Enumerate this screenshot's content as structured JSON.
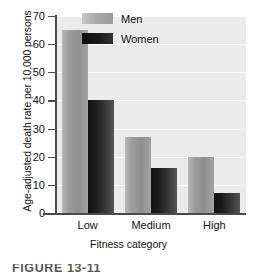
{
  "chart_data": {
    "type": "bar",
    "title": "",
    "subtitle": "",
    "xlabel": "Fitness category",
    "ylabel": "Age-adjusted death rate per 10,000 persons",
    "categories": [
      "Low",
      "Medium",
      "High"
    ],
    "series": [
      {
        "name": "Men",
        "values": [
          65,
          27,
          20
        ]
      },
      {
        "name": "Women",
        "values": [
          40,
          16,
          7
        ]
      }
    ],
    "yticks": [
      0,
      10,
      20,
      30,
      40,
      50,
      60,
      70
    ],
    "ylim": [
      0,
      70
    ],
    "grid": true,
    "grid_axis": "y",
    "legend_position": "top-right-inside",
    "colors": {
      "men": "#9c9c9c",
      "women": "#1c1c1c",
      "plot_background": "#ebebeb",
      "gridline": "#fafafa",
      "axis": "#4a4a4a",
      "text": "#111111"
    }
  },
  "caption": {
    "text": "FIGURE  13-11"
  }
}
